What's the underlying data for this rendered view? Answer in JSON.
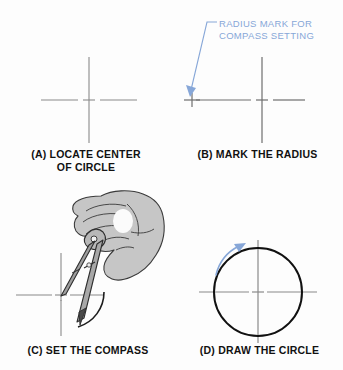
{
  "figure": {
    "background_color": "#fdfdfd",
    "annotation_color": "#87a7d8",
    "line_color": "#808080",
    "ink_color": "#111111",
    "hand_fill_color": "#c5c5c5"
  },
  "annotations": {
    "radius_mark": "RADIUS MARK FOR\nCOMPASS SETTING"
  },
  "panels": [
    {
      "id": "a",
      "caption": "(A) LOCATE CENTER\nOF CIRCLE",
      "description": "center crosshair with small plus mark"
    },
    {
      "id": "b",
      "caption": "(B) MARK THE RADIUS",
      "description": "center crosshair plus radius tick mark to the left"
    },
    {
      "id": "c",
      "caption": "(C) SET THE COMPASS",
      "description": "hand holding compass with needle at center, pencil sweeping arc"
    },
    {
      "id": "d",
      "caption": "(D) DRAW THE CIRCLE",
      "description": "completed circle with centerlines and rotation arrow"
    }
  ]
}
